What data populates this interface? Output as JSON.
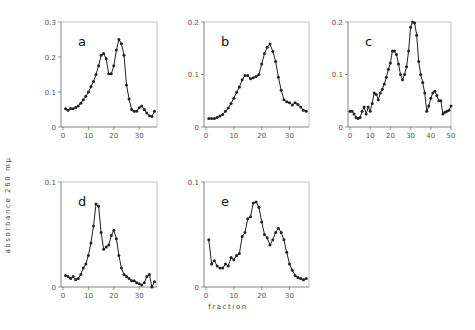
{
  "chart_data": [
    {
      "type": "line",
      "panel": "a",
      "xlim": [
        0,
        37
      ],
      "ylim": [
        0,
        0.3
      ],
      "xticks": [
        0,
        10,
        20,
        30
      ],
      "xtick_labels": [
        "0",
        "10",
        "20",
        "30"
      ],
      "yticks": [
        0,
        0.1,
        0.2,
        0.3
      ],
      "ytick_labels": [
        "0",
        "0.1",
        "0.2",
        "0.3"
      ],
      "x": [
        1,
        2,
        3,
        4,
        5,
        6,
        7,
        8,
        9,
        10,
        11,
        12,
        13,
        14,
        15,
        16,
        17,
        18,
        19,
        20,
        21,
        22,
        23,
        24,
        25,
        26,
        27,
        28,
        29,
        30,
        31,
        32,
        33,
        34,
        35,
        36
      ],
      "y": [
        0.052,
        0.048,
        0.053,
        0.052,
        0.056,
        0.06,
        0.068,
        0.078,
        0.088,
        0.1,
        0.115,
        0.13,
        0.15,
        0.175,
        0.205,
        0.21,
        0.195,
        0.152,
        0.152,
        0.175,
        0.22,
        0.25,
        0.238,
        0.205,
        0.12,
        0.08,
        0.05,
        0.045,
        0.045,
        0.055,
        0.06,
        0.05,
        0.04,
        0.032,
        0.03,
        0.045
      ]
    },
    {
      "type": "line",
      "panel": "b",
      "xlim": [
        0,
        37
      ],
      "ylim": [
        0,
        0.2
      ],
      "xticks": [
        0,
        10,
        20,
        30
      ],
      "xtick_labels": [
        "0",
        "10",
        "20",
        "30"
      ],
      "yticks": [
        0,
        0.1,
        0.2
      ],
      "ytick_labels": [
        "0",
        "0.1",
        "0.2"
      ],
      "x": [
        1,
        2,
        3,
        4,
        5,
        6,
        7,
        8,
        9,
        10,
        11,
        12,
        13,
        14,
        15,
        16,
        17,
        18,
        19,
        20,
        21,
        22,
        23,
        24,
        25,
        26,
        27,
        28,
        29,
        30,
        31,
        32,
        33,
        34,
        35,
        36
      ],
      "y": [
        0.016,
        0.016,
        0.016,
        0.018,
        0.021,
        0.024,
        0.03,
        0.036,
        0.045,
        0.055,
        0.066,
        0.076,
        0.09,
        0.098,
        0.098,
        0.092,
        0.094,
        0.096,
        0.1,
        0.12,
        0.14,
        0.152,
        0.158,
        0.144,
        0.125,
        0.095,
        0.07,
        0.052,
        0.048,
        0.046,
        0.042,
        0.046,
        0.043,
        0.038,
        0.032,
        0.03
      ]
    },
    {
      "type": "line",
      "panel": "c",
      "xlim": [
        0,
        50
      ],
      "ylim": [
        0,
        0.2
      ],
      "xticks": [
        0,
        10,
        20,
        30,
        40,
        50
      ],
      "xtick_labels": [
        "0",
        "10",
        "20",
        "30",
        "40",
        "50"
      ],
      "yticks": [
        0,
        0.1,
        0.2
      ],
      "ytick_labels": [
        "0",
        "0.1",
        "0.2"
      ],
      "x": [
        0,
        1,
        2,
        3,
        4,
        5,
        6,
        7,
        8,
        9,
        10,
        11,
        12,
        13,
        14,
        15,
        16,
        17,
        18,
        19,
        20,
        21,
        22,
        23,
        24,
        25,
        26,
        27,
        28,
        29,
        30,
        31,
        32,
        33,
        34,
        35,
        36,
        37,
        38,
        39,
        40,
        41,
        42,
        43,
        44,
        45,
        46,
        47,
        48,
        49,
        50
      ],
      "y": [
        0.03,
        0.03,
        0.025,
        0.018,
        0.016,
        0.018,
        0.03,
        0.038,
        0.025,
        0.038,
        0.03,
        0.045,
        0.065,
        0.062,
        0.052,
        0.065,
        0.072,
        0.082,
        0.095,
        0.11,
        0.122,
        0.145,
        0.145,
        0.138,
        0.12,
        0.1,
        0.09,
        0.1,
        0.115,
        0.145,
        0.19,
        0.2,
        0.198,
        0.175,
        0.125,
        0.1,
        0.085,
        0.065,
        0.03,
        0.04,
        0.055,
        0.065,
        0.068,
        0.06,
        0.05,
        0.05,
        0.025,
        0.028,
        0.03,
        0.032,
        0.04
      ]
    },
    {
      "type": "line",
      "panel": "d",
      "xlim": [
        0,
        37
      ],
      "ylim": [
        0,
        0.1
      ],
      "xticks": [
        0,
        10,
        20,
        30
      ],
      "xtick_labels": [
        "0",
        "10",
        "20",
        "30"
      ],
      "yticks": [
        0,
        0.1
      ],
      "ytick_labels": [
        "0",
        "0.1"
      ],
      "x": [
        1,
        2,
        3,
        4,
        5,
        6,
        7,
        8,
        9,
        10,
        11,
        12,
        13,
        14,
        15,
        16,
        17,
        18,
        19,
        20,
        21,
        22,
        23,
        24,
        25,
        26,
        27,
        28,
        29,
        30,
        31,
        32,
        33,
        34,
        35,
        36
      ],
      "y": [
        0.011,
        0.01,
        0.008,
        0.01,
        0.007,
        0.008,
        0.012,
        0.018,
        0.022,
        0.03,
        0.042,
        0.058,
        0.079,
        0.077,
        0.052,
        0.036,
        0.038,
        0.04,
        0.049,
        0.054,
        0.046,
        0.03,
        0.018,
        0.012,
        0.01,
        0.008,
        0.006,
        0.006,
        0.004,
        0.003,
        0.002,
        0.004,
        0.01,
        0.012,
        0.0,
        0.005
      ]
    },
    {
      "type": "line",
      "panel": "e",
      "xlim": [
        0,
        37
      ],
      "ylim": [
        0,
        0.1
      ],
      "xticks": [
        0,
        10,
        20,
        30
      ],
      "xtick_labels": [
        "0",
        "10",
        "20",
        "30"
      ],
      "yticks": [
        0,
        0.1
      ],
      "ytick_labels": [
        "0",
        "0.1"
      ],
      "x": [
        1,
        2,
        3,
        4,
        5,
        6,
        7,
        8,
        9,
        10,
        11,
        12,
        13,
        14,
        15,
        16,
        17,
        18,
        19,
        20,
        21,
        22,
        23,
        24,
        25,
        26,
        27,
        28,
        29,
        30,
        31,
        32,
        33,
        34,
        35,
        36
      ],
      "y": [
        0.045,
        0.022,
        0.025,
        0.02,
        0.018,
        0.018,
        0.022,
        0.02,
        0.028,
        0.026,
        0.03,
        0.032,
        0.048,
        0.052,
        0.065,
        0.067,
        0.08,
        0.081,
        0.076,
        0.062,
        0.05,
        0.047,
        0.04,
        0.045,
        0.052,
        0.056,
        0.052,
        0.045,
        0.033,
        0.022,
        0.016,
        0.011,
        0.009,
        0.008,
        0.007,
        0.008
      ]
    }
  ],
  "figure": {
    "ylabel": "absorbance 260 mμ",
    "xlabel": "fraction",
    "panel_labels": [
      "a",
      "b",
      "c",
      "d",
      "e"
    ],
    "line_color": "#222222",
    "axis_color": "#666666"
  }
}
